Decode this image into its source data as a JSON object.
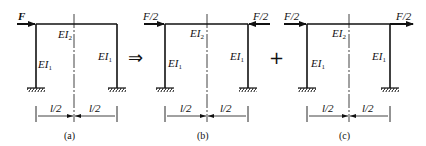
{
  "panels": [
    {
      "id": "a",
      "caption": "(a)",
      "forces": [
        {
          "label": "F",
          "direction": "right",
          "side": "left"
        }
      ],
      "beam_label": "EI",
      "beam_sub": "2",
      "left_col_label": "EI",
      "left_col_sub": "1",
      "right_col_label": "EI",
      "right_col_sub": "1",
      "dim_left": "l/2",
      "dim_right": "l/2"
    },
    {
      "id": "b",
      "caption": "(b)",
      "forces": [
        {
          "label": "F/2",
          "direction": "right",
          "side": "left"
        },
        {
          "label": "F/2",
          "direction": "left",
          "side": "right"
        }
      ],
      "beam_label": "EI",
      "beam_sub": "2",
      "left_col_label": "EI",
      "left_col_sub": "1",
      "right_col_label": "EI",
      "right_col_sub": "1",
      "dim_left": "l/2",
      "dim_right": "l/2"
    },
    {
      "id": "c",
      "caption": "(c)",
      "forces": [
        {
          "label": "F/2",
          "direction": "right",
          "side": "left"
        },
        {
          "label": "F/2",
          "direction": "right",
          "side": "right"
        }
      ],
      "beam_label": "EI",
      "beam_sub": "2",
      "left_col_label": "EI",
      "left_col_sub": "1",
      "right_col_label": "EI",
      "right_col_sub": "1",
      "dim_left": "l/2",
      "dim_right": "l/2"
    }
  ],
  "operators": {
    "implies": "⇒",
    "plus": "+"
  }
}
